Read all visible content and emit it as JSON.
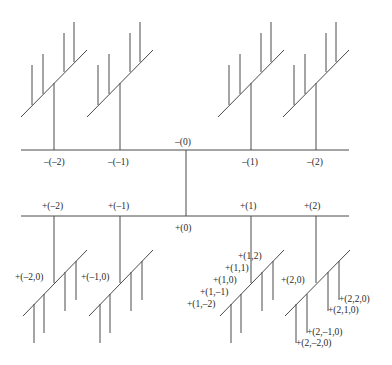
{
  "diagram": {
    "type": "tree",
    "colors": {
      "line": "#4a4a4a",
      "text": "#2a2a2a",
      "background": "#ffffff"
    },
    "root_minus_label": "–(0)",
    "root_plus_label": "+(0)",
    "minus_branches": [
      {
        "label": "–(–2)",
        "x": 54
      },
      {
        "label": "–(–1)",
        "x": 120
      },
      {
        "label": "–(1)",
        "x": 251
      },
      {
        "label": "–(2)",
        "x": 316
      }
    ],
    "plus_branches": [
      {
        "label": "+(–2)",
        "x": 54,
        "sub_label": "+(–2,0)"
      },
      {
        "label": "+(–1)",
        "x": 120,
        "sub_label": "+(–1,0)"
      },
      {
        "label": "+(1)",
        "x": 251
      },
      {
        "label": "+(2)",
        "x": 316,
        "sub_label": "+(2,0)"
      }
    ],
    "branch_1_leaves": [
      "+(1,2)",
      "+(1,1)",
      "+(1,0)",
      "+(1,–1)",
      "+(1,–2)"
    ],
    "branch_2_leaves": [
      "+(2,2,0)",
      "+(2,1,0)",
      "+(2,–1,0)",
      "+(2,–2,0)"
    ]
  }
}
